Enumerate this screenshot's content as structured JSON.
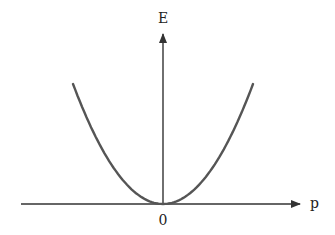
{
  "diagram": {
    "type": "line",
    "x_axis_label": "p",
    "y_axis_label": "E",
    "origin_label": "0",
    "curve": "E = k p^2",
    "colors": {
      "axis": "#333333",
      "curve": "#555555"
    }
  },
  "chart_data": {
    "type": "line",
    "title": "",
    "xlabel": "p",
    "ylabel": "E",
    "series": [
      {
        "name": "E(p)",
        "equation": "E ∝ p^2"
      }
    ],
    "xlim": [
      -1,
      1
    ],
    "ylim": [
      0,
      1
    ],
    "tick_labels": [
      "0"
    ],
    "grid": false
  }
}
